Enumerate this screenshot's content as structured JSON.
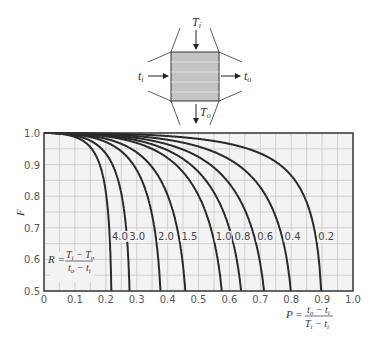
{
  "diagram": {
    "labels": {
      "top_in": "T",
      "top_in_sub": "i",
      "bottom_out": "T",
      "bottom_out_sub": "o",
      "left_in": "t",
      "left_in_sub": "i",
      "right_out": "t",
      "right_out_sub": "o"
    }
  },
  "chart_data": {
    "type": "line",
    "title": "",
    "xlabel": "P = (t_o − t_i) / (T_i − t_i)",
    "ylabel": "F",
    "xlim": [
      0,
      1.0
    ],
    "ylim": [
      0.5,
      1.0
    ],
    "x_ticks": [
      "0",
      "0.1",
      "0.2",
      "0.3",
      "0.4",
      "0.5",
      "0.6",
      "0.7",
      "0.8",
      "0.9",
      "1.0"
    ],
    "y_ticks": [
      "0.5",
      "0.6",
      "0.7",
      "0.8",
      "0.9",
      "1.0"
    ],
    "grid": true,
    "grid_step": 0.05,
    "legend_annotation": "R = (T_i − T_o) / (t_o − t_i)",
    "series": [
      {
        "name": "4.0",
        "R": 4.0,
        "p_at_F_0_5": 0.24
      },
      {
        "name": "3.0",
        "R": 3.0,
        "p_at_F_0_5": 0.31
      },
      {
        "name": "2.0",
        "R": 2.0,
        "p_at_F_0_5": 0.43
      },
      {
        "name": "1.5",
        "R": 1.5,
        "p_at_F_0_5": 0.5
      },
      {
        "name": "1.0",
        "R": 1.0,
        "p_at_F_0_5": 0.63
      },
      {
        "name": "0.8",
        "R": 0.8,
        "p_at_F_0_5": 0.68
      },
      {
        "name": "0.6",
        "R": 0.6,
        "p_at_F_0_5": 0.74
      },
      {
        "name": "0.4",
        "R": 0.4,
        "p_at_F_0_5": 0.82
      },
      {
        "name": "0.2",
        "R": 0.2,
        "p_at_F_0_5": 0.91
      }
    ],
    "curve_label_y": 0.665
  },
  "axis_labels": {
    "y": "F",
    "r_lhs": "R =",
    "r_num": "T",
    "r_num_sub1": "i",
    "r_num_mid": " − T",
    "r_num_sub2": "o",
    "r_den": "t",
    "r_den_sub1": "o",
    "r_den_mid": " − t",
    "r_den_sub2": "i",
    "p_lhs": "P =",
    "p_num": "t",
    "p_num_sub1": "o",
    "p_num_mid": " − t",
    "p_num_sub2": "i",
    "p_den": "T",
    "p_den_sub1": "i",
    "p_den_mid": " − t",
    "p_den_sub2": "i"
  },
  "colors": {
    "curve": "#2a2a2a",
    "grid": "#c8c8c8",
    "plot_bg": "#f3f3f3",
    "frame": "#333333",
    "box_fill": "#c4c4c4"
  }
}
